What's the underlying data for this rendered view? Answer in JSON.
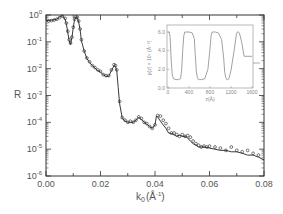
{
  "chart_data": [
    {
      "type": "scatter",
      "title": "",
      "xlabel": "k₀(Å⁻¹)",
      "ylabel": "R",
      "xlim": [
        0.0,
        0.08
      ],
      "ylim": [
        1e-06,
        1
      ],
      "yscale": "log",
      "grid": false,
      "x_ticks": [
        "0.00",
        "0.02",
        "0.04",
        "0.06",
        "0.08"
      ],
      "y_ticks": [
        "10^-6",
        "10^-5",
        "10^-4",
        "10^-3",
        "10^-2",
        "10^-1",
        "10^0"
      ],
      "series": [
        {
          "name": "measured (open circles)",
          "marker": "circle-open",
          "x": [
            0.001,
            0.002,
            0.003,
            0.004,
            0.005,
            0.006,
            0.007,
            0.0075,
            0.008,
            0.0085,
            0.009,
            0.0095,
            0.01,
            0.0105,
            0.011,
            0.0115,
            0.012,
            0.0125,
            0.013,
            0.014,
            0.015,
            0.016,
            0.017,
            0.018,
            0.019,
            0.02,
            0.021,
            0.022,
            0.023,
            0.024,
            0.025,
            0.0255,
            0.026,
            0.027,
            0.028,
            0.029,
            0.03,
            0.031,
            0.032,
            0.033,
            0.034,
            0.035,
            0.036,
            0.037,
            0.038,
            0.039,
            0.04,
            0.041,
            0.042,
            0.043,
            0.044,
            0.045,
            0.046,
            0.047,
            0.048,
            0.049,
            0.05,
            0.051,
            0.052,
            0.053,
            0.054,
            0.055,
            0.056,
            0.057,
            0.058,
            0.059,
            0.06,
            0.062,
            0.064,
            0.066,
            0.068,
            0.07,
            0.072,
            0.074,
            0.076,
            0.078
          ],
          "y": [
            0.6,
            0.62,
            0.65,
            0.7,
            0.8,
            0.9,
            0.75,
            0.5,
            0.25,
            0.12,
            0.09,
            0.15,
            0.35,
            0.7,
            0.85,
            0.82,
            0.6,
            0.3,
            0.12,
            0.045,
            0.025,
            0.018,
            0.013,
            0.011,
            0.009,
            0.008,
            0.006,
            0.0055,
            0.0055,
            0.009,
            0.014,
            0.013,
            0.009,
            0.0006,
            0.00015,
            0.00012,
            0.0001,
            0.00011,
            0.0001,
            0.00012,
            0.00016,
            0.00014,
            0.0001,
            9e-05,
            7e-05,
            6e-05,
            8e-05,
            0.00018,
            0.00017,
            0.00012,
            9e-05,
            6e-05,
            4e-05,
            4e-05,
            3.5e-05,
            3e-05,
            3.5e-05,
            3e-05,
            3.2e-05,
            2.8e-05,
            2e-05,
            1.6e-05,
            1.4e-05,
            1.2e-05,
            1.3e-05,
            1.2e-05,
            1.3e-05,
            1.2e-05,
            1.1e-05,
            9e-06,
            1.2e-05,
            9e-06,
            8e-06,
            9e-06,
            7e-06,
            6e-06
          ]
        },
        {
          "name": "fit (solid line)",
          "marker": "none",
          "x": [
            0.0,
            0.002,
            0.004,
            0.005,
            0.006,
            0.007,
            0.0075,
            0.008,
            0.0085,
            0.009,
            0.0095,
            0.01,
            0.0105,
            0.011,
            0.0115,
            0.012,
            0.0125,
            0.013,
            0.014,
            0.015,
            0.016,
            0.017,
            0.018,
            0.019,
            0.02,
            0.021,
            0.022,
            0.023,
            0.024,
            0.025,
            0.0255,
            0.026,
            0.0265,
            0.027,
            0.028,
            0.029,
            0.03,
            0.031,
            0.032,
            0.033,
            0.034,
            0.035,
            0.036,
            0.037,
            0.038,
            0.039,
            0.04,
            0.0405,
            0.041,
            0.042,
            0.043,
            0.044,
            0.045,
            0.046,
            0.047,
            0.048,
            0.049,
            0.05,
            0.051,
            0.052,
            0.053,
            0.054,
            0.055,
            0.056,
            0.058,
            0.06,
            0.062,
            0.064,
            0.066,
            0.068,
            0.07,
            0.072,
            0.074,
            0.076,
            0.078,
            0.08
          ],
          "y": [
            0.62,
            0.64,
            0.7,
            0.85,
            0.95,
            0.7,
            0.45,
            0.22,
            0.11,
            0.08,
            0.14,
            0.35,
            0.7,
            0.85,
            0.8,
            0.55,
            0.28,
            0.11,
            0.045,
            0.024,
            0.017,
            0.013,
            0.0105,
            0.0085,
            0.0075,
            0.006,
            0.0052,
            0.0052,
            0.0085,
            0.013,
            0.012,
            0.008,
            0.002,
            0.0005,
            0.00014,
            0.00011,
            0.0001,
            0.0001,
            0.0001,
            0.00012,
            0.00015,
            0.00013,
            0.0001,
            8.5e-05,
            7e-05,
            6e-05,
            8e-05,
            0.00017,
            0.00016,
            0.00011,
            8e-05,
            6e-05,
            4e-05,
            3.8e-05,
            3.4e-05,
            3e-05,
            3.3e-05,
            3e-05,
            3e-05,
            2.6e-05,
            2e-05,
            1.6e-05,
            1.4e-05,
            1.2e-05,
            1.2e-05,
            1.1e-05,
            1e-05,
            9e-06,
            9e-06,
            8e-06,
            8e-06,
            7e-06,
            6e-06,
            6e-06,
            5e-06,
            4e-06
          ]
        }
      ]
    },
    {
      "type": "line",
      "title": "inset: density profile",
      "xlabel": "z(Å)",
      "ylabel": "ρ(z) × 10⁶ (Å⁻²)",
      "xlim": [
        0,
        1600
      ],
      "ylim": [
        0.0,
        6.0
      ],
      "x_ticks": [
        "0",
        "400",
        "800",
        "1200",
        "1600"
      ],
      "y_ticks": [
        "0.0",
        "2.0",
        "4.0",
        "6.0"
      ],
      "series": [
        {
          "name": "profile",
          "x": [
            0,
            20,
            40,
            60,
            80,
            100,
            150,
            200,
            240,
            260,
            280,
            300,
            320,
            340,
            400,
            460,
            500,
            520,
            540,
            560,
            580,
            600,
            640,
            700,
            760,
            800,
            820,
            840,
            860,
            880,
            900,
            960,
            1020,
            1060,
            1080,
            1100,
            1120,
            1140,
            1160,
            1200,
            1260,
            1300,
            1320,
            1340,
            1360,
            1400,
            1450,
            1500,
            1600
          ],
          "y": [
            6.0,
            6.0,
            5.5,
            3.0,
            1.5,
            1.0,
            0.9,
            0.9,
            1.0,
            2.0,
            4.0,
            5.6,
            6.0,
            6.0,
            6.0,
            5.9,
            5.3,
            3.5,
            1.8,
            1.1,
            0.9,
            0.9,
            0.9,
            1.0,
            2.0,
            4.2,
            5.6,
            6.0,
            6.0,
            6.0,
            6.0,
            5.9,
            5.2,
            3.2,
            1.7,
            1.1,
            0.9,
            0.9,
            1.0,
            1.9,
            4.0,
            5.7,
            6.0,
            6.0,
            5.9,
            5.0,
            3.4,
            3.4,
            3.4
          ]
        }
      ]
    }
  ],
  "labels": {
    "y_axis": "R",
    "x_axis_main": "k",
    "x_axis_sub": "0",
    "x_axis_unit": "(Å",
    "x_axis_unit_exp": "-1",
    "x_axis_unit_close": ")",
    "y_tick_base": "10",
    "y_tick_exps": [
      "0",
      "-1",
      "-2",
      "-3",
      "-4",
      "-5",
      "-6"
    ],
    "x_ticks": [
      "0.00",
      "0.02",
      "0.04",
      "0.06",
      "0.08"
    ],
    "inset_x_axis": "z(Å)",
    "inset_y_axis": "ρ(z) × 10⁶ (Å⁻²)",
    "inset_x_ticks": [
      "0",
      "400",
      "800",
      "1200",
      "1600"
    ],
    "inset_y_ticks": [
      "0.0",
      "2.0",
      "4.0",
      "6.0"
    ]
  },
  "colors": {
    "axis": "#333333",
    "data": "#222222",
    "inset": "#8a8a8a",
    "text": "#555555"
  }
}
